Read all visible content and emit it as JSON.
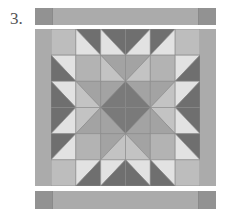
{
  "figure": {
    "label": "3."
  },
  "colors": {
    "background": "#ffffff",
    "border": "#ababab",
    "corner": "#929292",
    "light": "#e2e2e2",
    "dark": "#6f6f6f",
    "solid": "#bdbdbd",
    "mid": "#b3b3b3",
    "midLight": "#c3c3c3",
    "midDark": "#a3a3a3",
    "center": "#7a7a7a",
    "seam": "#8c8c8c"
  },
  "grid": {
    "rows": 6,
    "cols": 6,
    "cells": [
      [
        {
          "t": "solid",
          "c": "solid"
        },
        {
          "t": "tlbr",
          "a": "dark",
          "b": "light"
        },
        {
          "t": "tlbr",
          "a": "dark",
          "b": "light"
        },
        {
          "t": "trbl",
          "a": "dark",
          "b": "light"
        },
        {
          "t": "trbl",
          "a": "dark",
          "b": "light"
        },
        {
          "t": "solid",
          "c": "solid"
        }
      ],
      [
        {
          "t": "tlbr",
          "a": "light",
          "b": "dark"
        },
        {
          "t": "solid",
          "c": "mid"
        },
        {
          "t": "tlbr",
          "a": "midDark",
          "b": "midLight"
        },
        {
          "t": "trbl",
          "a": "midDark",
          "b": "midLight"
        },
        {
          "t": "solid",
          "c": "mid"
        },
        {
          "t": "trbl",
          "a": "light",
          "b": "dark"
        }
      ],
      [
        {
          "t": "tlbr",
          "a": "light",
          "b": "dark"
        },
        {
          "t": "tlbr",
          "a": "midDark",
          "b": "midLight"
        },
        {
          "t": "trbl",
          "a": "midDark",
          "b": "center"
        },
        {
          "t": "tlbr",
          "a": "midDark",
          "b": "center"
        },
        {
          "t": "trbl",
          "a": "midDark",
          "b": "midLight"
        },
        {
          "t": "trbl",
          "a": "light",
          "b": "dark"
        }
      ],
      [
        {
          "t": "trbl",
          "a": "dark",
          "b": "light"
        },
        {
          "t": "trbl",
          "a": "midLight",
          "b": "midDark"
        },
        {
          "t": "tlbr",
          "a": "center",
          "b": "midDark"
        },
        {
          "t": "trbl",
          "a": "center",
          "b": "midDark"
        },
        {
          "t": "tlbr",
          "a": "midLight",
          "b": "midDark"
        },
        {
          "t": "tlbr",
          "a": "dark",
          "b": "light"
        }
      ],
      [
        {
          "t": "trbl",
          "a": "dark",
          "b": "light"
        },
        {
          "t": "solid",
          "c": "mid"
        },
        {
          "t": "trbl",
          "a": "midDark",
          "b": "midLight"
        },
        {
          "t": "tlbr",
          "a": "midDark",
          "b": "midLight"
        },
        {
          "t": "solid",
          "c": "mid"
        },
        {
          "t": "tlbr",
          "a": "dark",
          "b": "light"
        }
      ],
      [
        {
          "t": "solid",
          "c": "solid"
        },
        {
          "t": "trbl",
          "a": "light",
          "b": "dark"
        },
        {
          "t": "trbl",
          "a": "light",
          "b": "dark"
        },
        {
          "t": "tlbr",
          "a": "light",
          "b": "dark"
        },
        {
          "t": "tlbr",
          "a": "light",
          "b": "dark"
        },
        {
          "t": "solid",
          "c": "solid"
        }
      ]
    ]
  }
}
